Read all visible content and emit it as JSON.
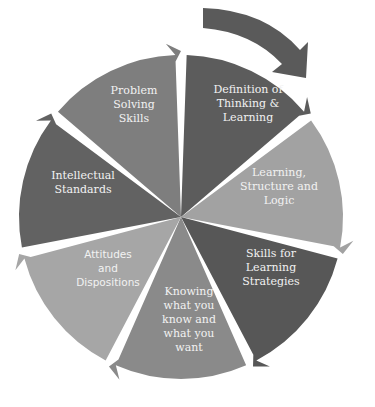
{
  "diagram": {
    "type": "cycle",
    "direction": "clockwise",
    "segments": [
      {
        "id": "definition",
        "lines": [
          "Definition of",
          "Thinking &",
          "Learning"
        ],
        "color": "#5c5c5c"
      },
      {
        "id": "structure",
        "lines": [
          "Learning,",
          "Structure and",
          "Logic"
        ],
        "color": "#a2a2a2"
      },
      {
        "id": "strategies",
        "lines": [
          "Skills for",
          "Learning",
          "Strategies"
        ],
        "color": "#575757"
      },
      {
        "id": "knowing",
        "lines": [
          "Knowing",
          "what you",
          "know and",
          "what you",
          "want"
        ],
        "color": "#8a8a8a"
      },
      {
        "id": "attitudes",
        "lines": [
          "Attitudes",
          "and",
          "Dispositions"
        ],
        "color": "#a6a6a6"
      },
      {
        "id": "standards",
        "lines": [
          "Intellectual",
          "Standards"
        ],
        "color": "#626262"
      },
      {
        "id": "problem",
        "lines": [
          "Problem",
          "Solving",
          "Skills"
        ],
        "color": "#7e7e7e"
      }
    ],
    "arrow_color": "#5a5a5a"
  }
}
